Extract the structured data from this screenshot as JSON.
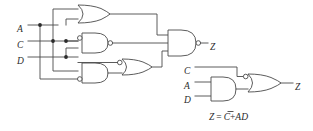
{
  "figure": {
    "kind": "logic-circuit-diagram",
    "background_color": "#ffffff",
    "line_color": "#4a4a4a",
    "text_color": "#2b2b2b"
  },
  "left_circuit": {
    "name": "original-gate-level-implementation",
    "inputs": [
      {
        "id": "A",
        "label": "A"
      },
      {
        "id": "C",
        "label": "C"
      },
      {
        "id": "D",
        "label": "D"
      }
    ],
    "output": {
      "id": "Z",
      "label": "Z"
    },
    "gates": [
      {
        "id": "g1",
        "type": "or",
        "label": "",
        "inverted_inputs": [],
        "inverted_output": false
      },
      {
        "id": "g2",
        "type": "nand",
        "label": "",
        "inverted_inputs": [
          "top"
        ],
        "inverted_output": true
      },
      {
        "id": "g3",
        "type": "and",
        "label": "",
        "inverted_inputs": [
          "bottom"
        ],
        "inverted_output": false
      },
      {
        "id": "g4",
        "type": "or",
        "label": "",
        "inverted_inputs": [
          "top"
        ],
        "inverted_output": false
      },
      {
        "id": "g5",
        "type": "nand",
        "label": "",
        "inverted_inputs": [],
        "inverted_output": true
      }
    ],
    "junction_count": 4
  },
  "right_circuit": {
    "name": "simplified-implementation",
    "inputs": [
      {
        "id": "C",
        "label": "C"
      },
      {
        "id": "A",
        "label": "A"
      },
      {
        "id": "D",
        "label": "D"
      }
    ],
    "output": {
      "id": "Z",
      "label": "Z"
    },
    "gates": [
      {
        "id": "h1",
        "type": "and",
        "label": "",
        "inverted_inputs": [],
        "inverted_output": false
      },
      {
        "id": "h2",
        "type": "or",
        "label": "",
        "inverted_inputs": [
          "top"
        ],
        "inverted_output": false
      }
    ],
    "equation": {
      "lhs": "Z",
      "eq": "=",
      "term1": "C",
      "term1_complemented": true,
      "plus": "+",
      "term2": "AD",
      "full_text": "Z = C̅+AD"
    }
  }
}
